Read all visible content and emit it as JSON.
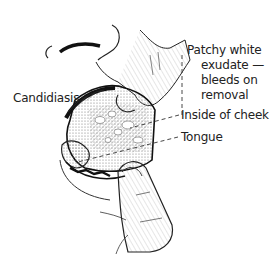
{
  "figure": {
    "title": "Candidiasis",
    "annotations": [
      {
        "id": "patchy",
        "lines": [
          "Patchy white",
          "exudate —",
          "bleeds on",
          "removal"
        ]
      },
      {
        "id": "cheek",
        "text": "Inside of cheek"
      },
      {
        "id": "tongue",
        "text": "Tongue"
      }
    ]
  },
  "colors": {
    "ink": "#1a1a1a",
    "background": "#ffffff",
    "shade": "#8a8a8a"
  }
}
